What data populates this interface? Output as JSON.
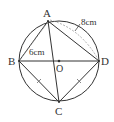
{
  "diagram": {
    "points": {
      "A": {
        "label": "A",
        "x": 48,
        "y": 21
      },
      "B": {
        "label": "B",
        "x": 19,
        "y": 61
      },
      "C": {
        "label": "C",
        "x": 59,
        "y": 102
      },
      "D": {
        "label": "D",
        "x": 99,
        "y": 61
      },
      "O": {
        "label": "O",
        "x": 59,
        "y": 61
      }
    },
    "circle": {
      "cx": 59,
      "cy": 61,
      "r": 40
    },
    "measurements": {
      "AB": "6cm",
      "AD": "8cm"
    },
    "colors": {
      "stroke": "#333333",
      "dashed": "#999999"
    }
  }
}
